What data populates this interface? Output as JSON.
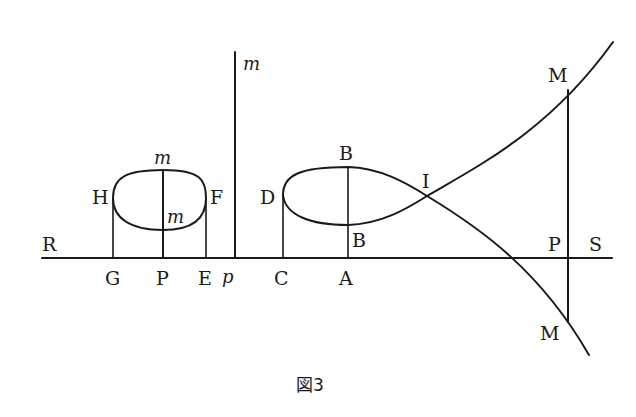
{
  "figure": {
    "caption": "図3"
  },
  "labels": {
    "R": "R",
    "G": "G",
    "P_left": "P",
    "E": "E",
    "p": "p",
    "C": "C",
    "A": "A",
    "P_right": "P",
    "S": "S",
    "H": "H",
    "F": "F",
    "m_top_left": "m",
    "m_inner": "m",
    "m_vertical": "m",
    "D": "D",
    "B_top": "B",
    "B_bottom": "B",
    "I": "I",
    "M_top": "M",
    "M_bottom": "M"
  },
  "colors": {
    "ink": "#1a1a1a",
    "background": "#ffffff"
  }
}
